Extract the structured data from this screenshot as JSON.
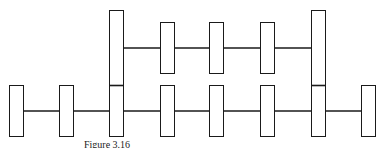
{
  "diagram": {
    "stroke_color": "#1a1a1a",
    "fill_color": "#ffffff",
    "bottom_row": {
      "line_y": 111,
      "node_top": 85,
      "node_bottom": 136,
      "node_width": 14,
      "nodes_x": [
        9,
        59,
        109,
        160,
        209,
        260,
        311,
        361
      ]
    },
    "top_row": {
      "line_y": 48,
      "node_top": 22,
      "node_bottom": 73,
      "node_width": 14,
      "nodes_x": [
        160,
        209,
        260
      ]
    },
    "tall_nodes": {
      "top": 10,
      "bottom": 136,
      "divider_y": 85,
      "nodes_x": [
        109,
        311
      ]
    }
  },
  "caption": {
    "text": "Figure 3.16"
  }
}
